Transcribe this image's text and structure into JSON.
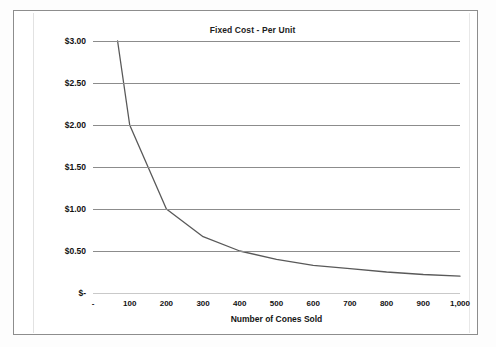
{
  "chart_data": {
    "type": "line",
    "title": "Fixed Cost - Per Unit",
    "xlabel": "Number of Cones Sold",
    "ylabel": "",
    "xlim": [
      0,
      1000
    ],
    "ylim": [
      0,
      3.0
    ],
    "grid": true,
    "legend": "none",
    "ytick_labels": [
      "$3.00",
      "$2.50",
      "$2.00",
      "$1.50",
      "$1.00",
      "$0.50",
      "$-"
    ],
    "ytick_values": [
      3.0,
      2.5,
      2.0,
      1.5,
      1.0,
      0.5,
      0.0
    ],
    "xtick_labels": [
      "-",
      "100",
      "200",
      "300",
      "400",
      "500",
      "600",
      "700",
      "800",
      "900",
      "1,000"
    ],
    "xtick_values": [
      0,
      100,
      200,
      300,
      400,
      500,
      600,
      700,
      800,
      900,
      1000
    ],
    "series": [
      {
        "name": "Fixed Cost Per Unit",
        "color": "#595959",
        "x": [
          67,
          100,
          200,
          300,
          400,
          500,
          600,
          700,
          800,
          900,
          1000
        ],
        "values": [
          3.0,
          2.0,
          1.0,
          0.67,
          0.5,
          0.4,
          0.33,
          0.29,
          0.25,
          0.22,
          0.2
        ]
      }
    ],
    "note_total_fixed_cost": 200
  }
}
